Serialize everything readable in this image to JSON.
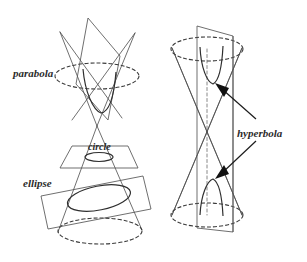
{
  "figure": {
    "background_color": "#ffffff",
    "ink_color": "#2f2f2f",
    "width": 307,
    "height": 262
  },
  "labels": {
    "parabola": "parabola",
    "circle": "circle",
    "ellipse": "ellipse",
    "hyperbola": "hyperbola"
  },
  "left_figure": {
    "name": "double-cone-with-three-cutting-planes",
    "sections": [
      {
        "key": "parabola",
        "label": "parabola",
        "plane": "slanted-parallel-to-slant-side",
        "cone": "upper"
      },
      {
        "key": "circle",
        "label": "circle",
        "plane": "horizontal",
        "cone": "lower-apex"
      },
      {
        "key": "ellipse",
        "label": "ellipse",
        "plane": "oblique",
        "cone": "lower"
      }
    ]
  },
  "right_figure": {
    "name": "double-cone-with-vertical-plane",
    "sections": [
      {
        "key": "hyperbola",
        "label": "hyperbola",
        "plane": "vertical",
        "branches": 2
      }
    ],
    "arrows": [
      {
        "target": "upper-branch",
        "direction": "up-left"
      },
      {
        "target": "lower-branch",
        "direction": "down-left"
      }
    ]
  }
}
